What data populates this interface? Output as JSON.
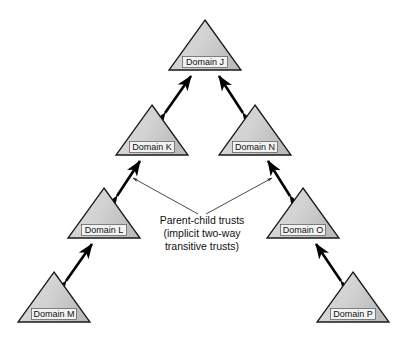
{
  "diagram": {
    "colors": {
      "triangle_fill_light": "#d8d8d8",
      "triangle_fill_dark": "#bdbdbd",
      "triangle_stroke": "#1a1a1a",
      "arrow_color": "#000000",
      "leader_color": "#333333",
      "label_box_fill": "#f2f2f2",
      "label_box_stroke": "#555555",
      "text_color": "#111111",
      "background": "#ffffff"
    },
    "nodes": [
      {
        "id": "J",
        "label": "Domain J",
        "cx": 205,
        "base_y": 70,
        "half_width": 36,
        "height": 50
      },
      {
        "id": "K",
        "label": "Domain K",
        "cx": 152,
        "base_y": 155,
        "half_width": 36,
        "height": 50
      },
      {
        "id": "N",
        "label": "Domain N",
        "cx": 255,
        "base_y": 155,
        "half_width": 36,
        "height": 50
      },
      {
        "id": "L",
        "label": "Domain L",
        "cx": 104,
        "base_y": 238,
        "half_width": 36,
        "height": 50
      },
      {
        "id": "O",
        "label": "Domain O",
        "cx": 303,
        "base_y": 238,
        "half_width": 36,
        "height": 50
      },
      {
        "id": "M",
        "label": "Domain M",
        "cx": 54,
        "base_y": 322,
        "half_width": 36,
        "height": 50
      },
      {
        "id": "P",
        "label": "Domain P",
        "cx": 353,
        "base_y": 322,
        "half_width": 36,
        "height": 50
      }
    ],
    "links": [
      {
        "from": "K",
        "to": "J",
        "type": "double-arrow",
        "x1": 165,
        "y1": 113,
        "x2": 191,
        "y2": 76
      },
      {
        "from": "N",
        "to": "J",
        "type": "double-arrow",
        "x1": 243,
        "y1": 113,
        "x2": 219,
        "y2": 76
      },
      {
        "from": "L",
        "to": "K",
        "type": "double-arrow",
        "x1": 117,
        "y1": 196,
        "x2": 140,
        "y2": 161
      },
      {
        "from": "O",
        "to": "N",
        "type": "double-arrow",
        "x1": 290,
        "y1": 196,
        "x2": 268,
        "y2": 161
      },
      {
        "from": "M",
        "to": "L",
        "type": "double-arrow",
        "x1": 66,
        "y1": 281,
        "x2": 92,
        "y2": 244
      },
      {
        "from": "P",
        "to": "O",
        "type": "double-arrow",
        "x1": 341,
        "y1": 281,
        "x2": 316,
        "y2": 244
      }
    ],
    "annotation": {
      "name": "parent-child-trusts-note",
      "lines": [
        "Parent-child trusts",
        "(implicit two-way",
        "transitive trusts)"
      ],
      "text_center_x": 202,
      "first_line_y": 224,
      "line_height": 13,
      "leaders": [
        {
          "x1": 198,
          "y1": 214,
          "x2": 133,
          "y2": 178,
          "arrow_at": "end"
        },
        {
          "x1": 206,
          "y1": 214,
          "x2": 272,
          "y2": 178,
          "arrow_at": "end"
        }
      ]
    }
  }
}
